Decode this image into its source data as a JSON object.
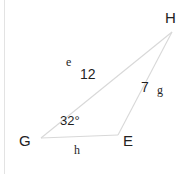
{
  "figure": {
    "type": "triangle-diagram",
    "width": 193,
    "height": 174,
    "background_color": "#ffffff",
    "stroke_color": "#d8d8d8",
    "text_color": "#1f1f1f"
  },
  "vertices": [
    {
      "name": "G",
      "label": "G",
      "x": 41,
      "y": 138,
      "label_x": 19,
      "label_y": 133
    },
    {
      "name": "E",
      "label": "E",
      "x": 118,
      "y": 135,
      "label_x": 123,
      "label_y": 133
    },
    {
      "name": "H",
      "label": "H",
      "x": 172,
      "y": 32,
      "label_x": 165,
      "label_y": 10
    }
  ],
  "sides": [
    {
      "name": "e",
      "letter": "e",
      "measure": "12",
      "from": "G",
      "to": "H",
      "letter_x": 66,
      "letter_y": 56,
      "measure_x": 80,
      "measure_y": 67
    },
    {
      "name": "g",
      "letter": "g",
      "measure": "7",
      "from": "E",
      "to": "H",
      "letter_x": 157,
      "letter_y": 84,
      "measure_x": 141,
      "measure_y": 80
    },
    {
      "name": "h",
      "letter": "h",
      "measure": "",
      "from": "G",
      "to": "E",
      "letter_x": 74,
      "letter_y": 144,
      "measure_x": 0,
      "measure_y": 0
    }
  ],
  "angles": [
    {
      "at_vertex": "G",
      "label": "32°",
      "value": 32,
      "unit": "degrees",
      "label_x": 60,
      "label_y": 114
    }
  ]
}
